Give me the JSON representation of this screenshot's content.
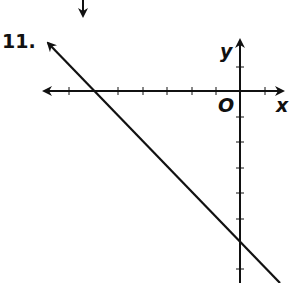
{
  "problem": {
    "number": "11."
  },
  "axes": {
    "x_label": "x",
    "y_label": "y",
    "origin_label": "O",
    "tick_spacing_px": 24.8,
    "x_ticks": [
      -7,
      -6,
      -5,
      -4,
      -3,
      -2,
      -1,
      1
    ],
    "y_ticks": [
      2,
      1,
      -1,
      -2,
      -3,
      -4,
      -5,
      -6,
      -7
    ]
  },
  "line": {
    "description": "line with x-intercept -6 and y-intercept -6",
    "equation": "y = -x - 6",
    "x_intercept": -6,
    "y_intercept": -6
  },
  "colors": {
    "ink": "#111111",
    "background": "#ffffff"
  }
}
